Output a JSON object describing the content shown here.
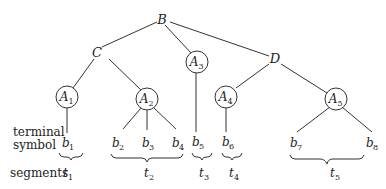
{
  "diagram": {
    "type": "parse-tree",
    "nodes": {
      "B": {
        "label": "B"
      },
      "C": {
        "label": "C"
      },
      "D": {
        "label": "D"
      },
      "A1": {
        "label": "A",
        "sub": "1"
      },
      "A2": {
        "label": "A",
        "sub": "2"
      },
      "A3": {
        "label": "A",
        "sub": "3"
      },
      "A4": {
        "label": "A",
        "sub": "4"
      },
      "A5": {
        "label": "A",
        "sub": "5"
      }
    },
    "terminals": [
      {
        "label": "b",
        "sub": "1"
      },
      {
        "label": "b",
        "sub": "2"
      },
      {
        "label": "b",
        "sub": "3"
      },
      {
        "label": "b",
        "sub": "4"
      },
      {
        "label": "b",
        "sub": "5"
      },
      {
        "label": "b",
        "sub": "6"
      },
      {
        "label": "b",
        "sub": "7"
      },
      {
        "label": "b",
        "sub": "8"
      }
    ],
    "segments": [
      {
        "label": "t",
        "sub": "1"
      },
      {
        "label": "t",
        "sub": "2"
      },
      {
        "label": "t",
        "sub": "3"
      },
      {
        "label": "t",
        "sub": "4"
      },
      {
        "label": "t",
        "sub": "5"
      }
    ],
    "edges": [
      [
        "B",
        "C"
      ],
      [
        "B",
        "A3"
      ],
      [
        "B",
        "D"
      ],
      [
        "C",
        "A1"
      ],
      [
        "C",
        "A2"
      ],
      [
        "D",
        "A4"
      ],
      [
        "D",
        "A5"
      ],
      [
        "A1",
        "b1"
      ],
      [
        "A2",
        "b2"
      ],
      [
        "A2",
        "b3"
      ],
      [
        "A2",
        "b4"
      ],
      [
        "A3",
        "b5"
      ],
      [
        "A4",
        "b6"
      ],
      [
        "A5",
        "b7"
      ],
      [
        "A5",
        "b8"
      ]
    ],
    "row_labels": {
      "terminal_line1": "terminal",
      "terminal_line2": "symbol",
      "segments": "segments"
    }
  }
}
